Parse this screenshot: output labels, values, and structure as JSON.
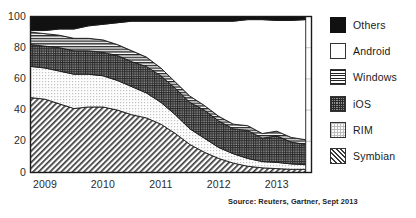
{
  "chart_data": {
    "type": "area",
    "stacked": true,
    "title": "",
    "xlabel": "",
    "ylabel": "",
    "xlim": [
      2008.75,
      2013.6
    ],
    "ylim": [
      0,
      100
    ],
    "grid": true,
    "legend_position": "right",
    "x_tick_labels": [
      "2009",
      "2010",
      "2011",
      "2012",
      "2013"
    ],
    "x_tick_values": [
      2009,
      2010,
      2011,
      2012,
      2013
    ],
    "y_tick_labels": [
      "0",
      "20",
      "40",
      "60",
      "80",
      "100"
    ],
    "y_tick_values": [
      0,
      20,
      40,
      60,
      80,
      100
    ],
    "x": [
      2008.75,
      2009.0,
      2009.25,
      2009.5,
      2009.75,
      2010.0,
      2010.25,
      2010.5,
      2010.75,
      2011.0,
      2011.25,
      2011.5,
      2011.75,
      2012.0,
      2012.25,
      2012.5,
      2012.75,
      2013.0,
      2013.25,
      2013.5
    ],
    "series": [
      {
        "name": "Symbian",
        "pattern": "diagonal-hatch",
        "values": [
          48,
          47,
          44,
          41,
          42,
          42,
          40,
          37,
          35,
          31,
          25,
          18,
          13,
          9,
          6,
          4,
          3,
          2.5,
          2,
          2
        ]
      },
      {
        "name": "RIM",
        "pattern": "light-dots",
        "values": [
          20,
          20,
          21,
          22,
          21,
          20,
          19,
          18,
          16,
          14,
          12,
          10,
          9,
          7,
          6,
          5,
          4,
          4,
          3.5,
          3
        ]
      },
      {
        "name": "iOS",
        "pattern": "crosshatch",
        "values": [
          14,
          14,
          15,
          15,
          15,
          15,
          16,
          16,
          17,
          17,
          17,
          17,
          18,
          17,
          16,
          18,
          15,
          17,
          14,
          13
        ]
      },
      {
        "name": "Windows",
        "pattern": "horizontal-lines",
        "values": [
          8,
          8,
          8,
          8,
          8,
          8,
          7,
          7,
          6,
          5,
          4,
          4,
          3,
          3,
          3,
          3,
          3,
          3,
          3,
          3
        ]
      },
      {
        "name": "Android",
        "pattern": "solid-white",
        "values": [
          1,
          2,
          4,
          6,
          8,
          10,
          14,
          19,
          23,
          30,
          39,
          48,
          54,
          61,
          66,
          68,
          73,
          71,
          75,
          77
        ]
      },
      {
        "name": "Others",
        "pattern": "solid-black",
        "values": [
          9,
          9,
          8,
          8,
          6,
          5,
          4,
          3,
          3,
          3,
          3,
          3,
          3,
          3,
          3,
          2,
          2,
          2.5,
          2.5,
          2
        ]
      }
    ]
  },
  "legend": {
    "items": [
      {
        "label": "Others",
        "swatch_class": "sw-others"
      },
      {
        "label": "Android",
        "swatch_class": "sw-android"
      },
      {
        "label": "Windows",
        "swatch_class": "sw-windows"
      },
      {
        "label": "iOS",
        "swatch_class": "sw-ios"
      },
      {
        "label": "RIM",
        "swatch_class": "sw-rim"
      },
      {
        "label": "Symbian",
        "swatch_class": "sw-symbian"
      }
    ]
  },
  "source_note": "Source: Reuters, Gartner, Sept 2013",
  "colors": {
    "frame": "#1a1a1a",
    "grid": "#b9b9b9",
    "text": "#1a1a1a",
    "black_fill": "#111111",
    "white_fill": "#ffffff"
  }
}
